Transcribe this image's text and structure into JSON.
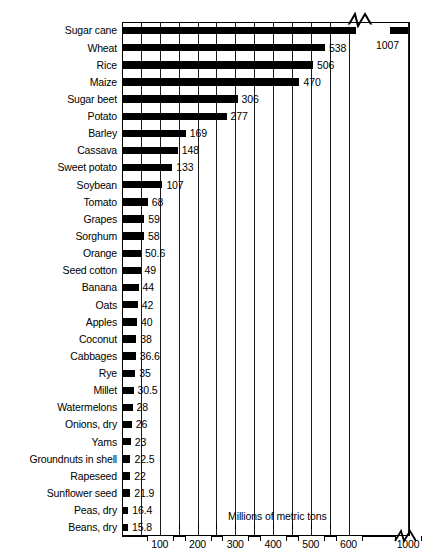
{
  "chart_data": {
    "type": "bar",
    "orientation": "horizontal",
    "title": "",
    "xlabel": "Millions of metric tons",
    "ylabel": "",
    "grid": true,
    "legend": null,
    "xlim": [
      0,
      1050
    ],
    "axis_break": {
      "present": true,
      "after": 620,
      "resumes_at": 980,
      "symbol": "zig-zag"
    },
    "xticks": [
      100,
      200,
      300,
      400,
      500,
      600,
      1000
    ],
    "xtick_labels": [
      "100",
      "200",
      "300",
      "400",
      "500",
      "600",
      "1000"
    ],
    "minor_gridline_step": 50,
    "categories": [
      "Sugar cane",
      "Wheat",
      "Rice",
      "Maize",
      "Sugar beet",
      "Potato",
      "Barley",
      "Cassava",
      "Sweet potato",
      "Soybean",
      "Tomato",
      "Grapes",
      "Sorghum",
      "Orange",
      "Seed cotton",
      "Banana",
      "Oats",
      "Apples",
      "Coconut",
      "Cabbages",
      "Rye",
      "Millet",
      "Watermelons",
      "Onions, dry",
      "Yams",
      "Groundnuts in shell",
      "Rapeseed",
      "Sunflower seed",
      "Peas, dry",
      "Beans, dry"
    ],
    "values": [
      1007,
      538,
      506,
      470,
      306,
      277,
      169,
      148,
      133,
      107,
      68,
      59,
      58,
      50.6,
      49,
      44,
      42,
      40,
      38,
      36.6,
      35,
      30.5,
      28,
      26,
      23,
      22.5,
      22,
      21.9,
      16.4,
      15.8
    ],
    "value_labels": [
      "1007",
      "538",
      "506",
      "470",
      "306",
      "277",
      "169",
      "148",
      "133",
      "107",
      "68",
      "59",
      "58",
      "50.6",
      "49",
      "44",
      "42",
      "40",
      "38",
      "36.6",
      "35",
      "30.5",
      "28",
      "26",
      "23",
      "22.5",
      "22",
      "21.9",
      "16.4",
      "15.8"
    ]
  },
  "colors": {
    "bar": "#000000",
    "grid": "#1a1a1a",
    "frame": "#000000",
    "background": "#ffffff",
    "text": "#000000"
  }
}
